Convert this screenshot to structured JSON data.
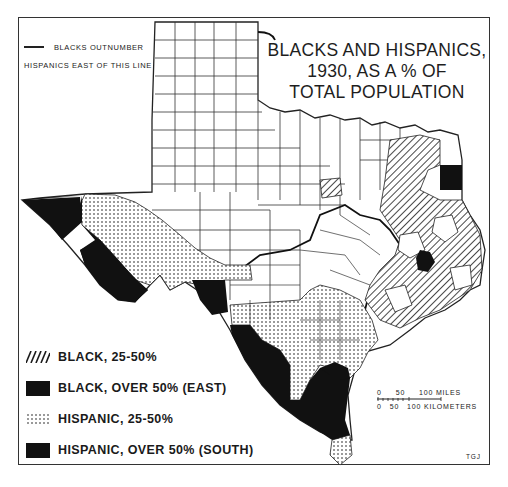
{
  "map": {
    "title_lines": [
      "BLACKS AND HISPANICS,",
      "1930, AS A % OF",
      "TOTAL POPULATION"
    ],
    "line_note": {
      "line1": "BLACKS OUTNUMBER",
      "line2": "HISPANICS EAST OF THIS LINE"
    },
    "legend": [
      {
        "pattern": "hatch",
        "label": "BLACK, 25-50%"
      },
      {
        "pattern": "solid",
        "label": "BLACK, OVER 50% (EAST)"
      },
      {
        "pattern": "dots",
        "label": "HISPANIC, 25-50%"
      },
      {
        "pattern": "solid",
        "label": "HISPANIC, OVER 50% (SOUTH)"
      }
    ],
    "scale": {
      "miles_ticks": [
        "0",
        "50",
        "100 MILES"
      ],
      "km_ticks": [
        "0",
        "50",
        "100 KILOMETERS"
      ]
    },
    "credit": "TGJ",
    "colors": {
      "ink": "#1a1a1a",
      "paper": "#ffffff",
      "frame": "#333333"
    }
  }
}
